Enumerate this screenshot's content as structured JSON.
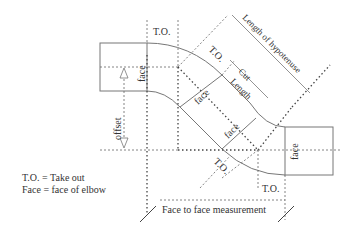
{
  "diagram": {
    "labels": {
      "to_top": "T.O.",
      "to_diag_upper": "T.O.",
      "to_diag_lower": "T.O.",
      "to_bottom": "T.O.",
      "face_left": "face",
      "face_upper_diag": "face",
      "face_lower_diag": "face",
      "face_right": "face",
      "offset": "offset",
      "cut": "Cut",
      "length": "Length",
      "hypotenuse": "Length of hypotenuse",
      "face_to_face": "Face to face measurement"
    },
    "legend": [
      "T.O. = Take out",
      "Face = face of elbow"
    ],
    "colors": {
      "pipe": "#777777",
      "dotted": "#444444",
      "text": "#333333"
    }
  }
}
